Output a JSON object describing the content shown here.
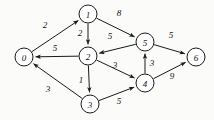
{
  "figure": {
    "background_color": "#fbfbfa",
    "stroke_color": "#1a1a1a",
    "node_fill_color": "#ffffff",
    "node_radius": 9,
    "width": 214,
    "height": 120
  },
  "chart_data": {
    "type": "diagram",
    "diagram_type": "directed-weighted-graph",
    "title": "",
    "nodes": [
      {
        "id": "0",
        "label": "0",
        "x": 24,
        "y": 57
      },
      {
        "id": "1",
        "label": "1",
        "x": 88,
        "y": 14
      },
      {
        "id": "2",
        "label": "2",
        "x": 88,
        "y": 56
      },
      {
        "id": "3",
        "label": "3",
        "x": 90,
        "y": 104
      },
      {
        "id": "4",
        "label": "4",
        "x": 145,
        "y": 83
      },
      {
        "id": "5",
        "label": "5",
        "x": 145,
        "y": 42
      },
      {
        "id": "6",
        "label": "6",
        "x": 196,
        "y": 57
      }
    ],
    "edges": [
      {
        "from": "0",
        "to": "1",
        "weight": 2,
        "label_x": 45,
        "label_y": 25
      },
      {
        "from": "1",
        "to": "2",
        "weight": 2,
        "label_x": 80,
        "label_y": 33
      },
      {
        "from": "1",
        "to": "5",
        "weight": 8,
        "label_x": 119,
        "label_y": 13
      },
      {
        "from": "2",
        "to": "0",
        "weight": 5,
        "label_x": 55,
        "label_y": 48
      },
      {
        "from": "2",
        "to": "3",
        "weight": 1,
        "label_x": 81,
        "label_y": 80
      },
      {
        "from": "2",
        "to": "4",
        "weight": 3,
        "label_x": 115,
        "label_y": 65
      },
      {
        "from": "3",
        "to": "0",
        "weight": 3,
        "label_x": 48,
        "label_y": 89
      },
      {
        "from": "3",
        "to": "4",
        "weight": 5,
        "label_x": 119,
        "label_y": 101
      },
      {
        "from": "4",
        "to": "5",
        "weight": 3,
        "label_x": 152,
        "label_y": 63
      },
      {
        "from": "4",
        "to": "6",
        "weight": 9,
        "label_x": 172,
        "label_y": 76
      },
      {
        "from": "5",
        "to": "2",
        "weight": 5,
        "label_x": 110,
        "label_y": 36
      },
      {
        "from": "5",
        "to": "6",
        "weight": 5,
        "label_x": 171,
        "label_y": 35
      }
    ]
  }
}
